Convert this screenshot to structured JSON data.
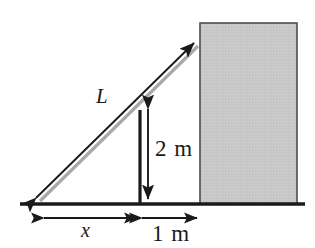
{
  "figure": {
    "background_color": "#ffffff",
    "line_color": "#1a1a1a",
    "ladder_color": "#a8a8a8",
    "wall_fill_color": "#c8c8c8",
    "wall_border_color": "#4d4d4d"
  },
  "labels": {
    "ladder_length": "L",
    "pole_height": "2 m",
    "base_distance": "x",
    "wall_offset": "1 m"
  },
  "geometry": {
    "ground_line": {
      "x1": 20,
      "y1": 204,
      "x2": 305,
      "y2": 204
    },
    "wall": {
      "x": 200,
      "y": 23,
      "width": 97,
      "height": 181
    },
    "ladder": {
      "x1": 36,
      "y1": 198,
      "x2": 194,
      "y2": 43
    },
    "pole": {
      "x": 140,
      "y_top": 110,
      "y_bottom": 204
    },
    "height_dimension": {
      "x": 148,
      "y_top": 108,
      "y_bottom": 200
    },
    "base_dimension": {
      "y": 218,
      "x1": 44,
      "x2": 137
    },
    "offset_dimension": {
      "y": 218,
      "x1": 142,
      "x2": 197
    }
  }
}
